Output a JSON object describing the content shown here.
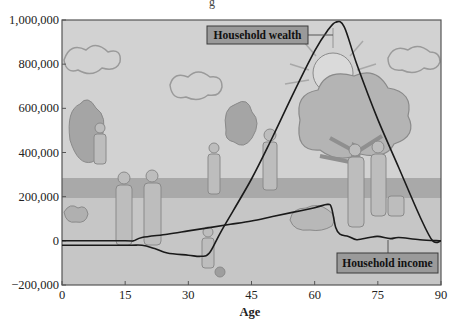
{
  "chart_data": {
    "type": "line",
    "title": "",
    "xlabel": "Age",
    "ylabel": "",
    "xlim": [
      0,
      90
    ],
    "ylim": [
      -200000,
      1000000
    ],
    "x_ticks": [
      0,
      15,
      30,
      45,
      60,
      75,
      90
    ],
    "x_tick_labels": [
      "0",
      "15",
      "30",
      "45",
      "60",
      "75",
      "90"
    ],
    "y_ticks": [
      -200000,
      0,
      200000,
      400000,
      600000,
      800000,
      1000000
    ],
    "y_tick_labels": [
      "−200,000",
      "0",
      "200,000",
      "400,000",
      "600,000",
      "800,000",
      "1,000,000"
    ],
    "grid": false,
    "legend": "callout labels on chart",
    "background": "illustrated grayscale park scene (clouds, sun, trees, people of various ages)",
    "series": [
      {
        "name": "Household income",
        "label_position": "bottom-right",
        "points": [
          [
            0,
            0
          ],
          [
            15,
            0
          ],
          [
            17,
            0
          ],
          [
            19,
            15000
          ],
          [
            25,
            30000
          ],
          [
            30,
            45000
          ],
          [
            35,
            60000
          ],
          [
            40,
            75000
          ],
          [
            45,
            90000
          ],
          [
            50,
            110000
          ],
          [
            55,
            130000
          ],
          [
            60,
            150000
          ],
          [
            63,
            165000
          ],
          [
            64,
            150000
          ],
          [
            65,
            60000
          ],
          [
            66,
            30000
          ],
          [
            68,
            20000
          ],
          [
            70,
            5000
          ],
          [
            73,
            15000
          ],
          [
            75,
            20000
          ],
          [
            78,
            10000
          ],
          [
            80,
            15000
          ],
          [
            85,
            5000
          ],
          [
            90,
            0
          ]
        ]
      },
      {
        "name": "Household wealth",
        "label_position": "top-center",
        "points": [
          [
            0,
            -20000
          ],
          [
            15,
            -20000
          ],
          [
            19,
            -20000
          ],
          [
            22,
            -35000
          ],
          [
            25,
            -55000
          ],
          [
            30,
            -65000
          ],
          [
            33,
            -70000
          ],
          [
            35,
            -55000
          ],
          [
            38,
            50000
          ],
          [
            45,
            280000
          ],
          [
            50,
            470000
          ],
          [
            55,
            670000
          ],
          [
            60,
            860000
          ],
          [
            63,
            950000
          ],
          [
            65,
            990000
          ],
          [
            67,
            970000
          ],
          [
            70,
            800000
          ],
          [
            75,
            550000
          ],
          [
            80,
            330000
          ],
          [
            85,
            110000
          ],
          [
            88,
            0
          ],
          [
            90,
            0
          ]
        ]
      }
    ]
  },
  "labels": {
    "xlabel": "Age",
    "wealth_callout": "Household wealth",
    "income_callout": "Household income",
    "title_stub": "g"
  },
  "colors": {
    "line": "#1a1a1a",
    "plot_bg": "#cfcfcf",
    "ground_band": "#a9a9a9",
    "callout_fill": "#9a9a9a",
    "callout_border": "#3a3a3a",
    "frame": "#555555"
  }
}
